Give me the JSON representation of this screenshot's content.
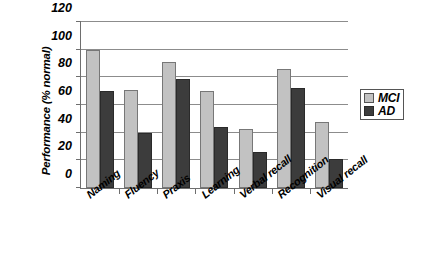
{
  "chart_data": {
    "type": "bar",
    "title": "",
    "subtitle": "",
    "xlabel": "",
    "ylabel": "Performance (% normal)",
    "ylim": [
      0,
      120
    ],
    "yticks": [
      0,
      20,
      40,
      60,
      80,
      100,
      120
    ],
    "ytick_labels": [
      "0",
      "20",
      "40",
      "60",
      "80",
      "100",
      "120"
    ],
    "grid": "horizontal",
    "legend_position": "right",
    "categories": [
      "Naming",
      "Fluency",
      "Praxis",
      "Learning",
      "Verbal recall",
      "Recognition",
      "Visual recall"
    ],
    "series": [
      {
        "name": "MCI",
        "color": "#c2c2c2",
        "values": [
          100,
          71,
          91,
          70,
          43,
          86,
          48
        ]
      },
      {
        "name": "AD",
        "color": "#3c3c3c",
        "values": [
          70,
          40,
          79,
          44,
          26,
          72,
          21
        ]
      }
    ]
  }
}
